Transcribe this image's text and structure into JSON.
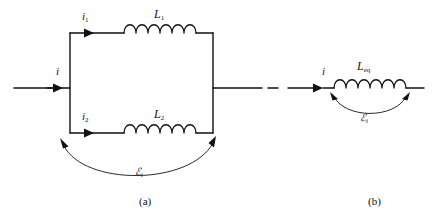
{
  "figure": {
    "background": "#ffffff",
    "stroke": "#111111",
    "panels": [
      {
        "caption": "(a)",
        "description": "two inductors in parallel",
        "labels": {
          "source_current": "i",
          "branch1_current": "i",
          "branch1_current_sub": "1",
          "branch2_current": "i",
          "branch2_current_sub": "2",
          "inductor1": "L",
          "inductor1_sub": "1",
          "inductor2": "L",
          "inductor2_sub": "2",
          "emf": "ℰ",
          "emf_sub": "i"
        }
      },
      {
        "caption": "(b)",
        "description": "equivalent single inductor",
        "labels": {
          "current": "i",
          "inductor_eq": "L",
          "inductor_eq_sub": "eq",
          "emf": "ℰ",
          "emf_sub": "i"
        }
      }
    ]
  }
}
